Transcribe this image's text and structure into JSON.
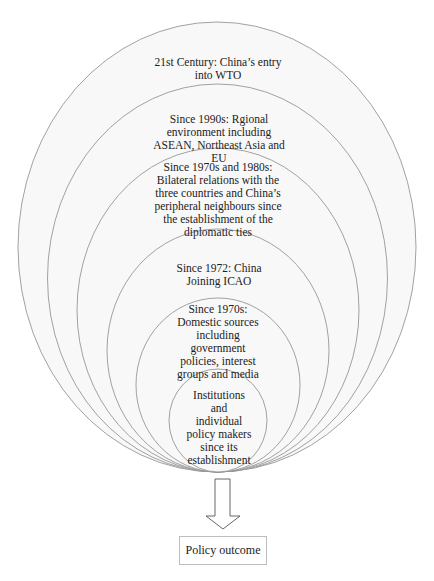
{
  "diagram": {
    "type": "nested-ellipses-influence-model",
    "layers": [
      {
        "id": 1,
        "label": "21st Century: China’s entry into WTO"
      },
      {
        "id": 2,
        "label": "Since 1990s: Rgional environment including ASEAN, Northeast Asia and EU"
      },
      {
        "id": 3,
        "label": "Since 1970s and 1980s: Bilateral relations with the three countries and China’s peripheral neighbours since the establishment of the diplomatic ties"
      },
      {
        "id": 4,
        "label": "Since 1972: China Joining ICAO"
      },
      {
        "id": 5,
        "label": "Since 1970s: Domestic sources including government policies, interest groups and media"
      },
      {
        "id": 6,
        "label": "Institutions and individual policy makers since its establishment"
      }
    ],
    "arrow": {
      "direction": "down",
      "style": "hollow"
    },
    "outcome": {
      "label": "Policy outcome"
    }
  },
  "colors": {
    "ellipse_stroke": "#8a8a8a",
    "fill": "#f7f7f7",
    "text": "#222222",
    "box_border": "#bdbdbd"
  }
}
